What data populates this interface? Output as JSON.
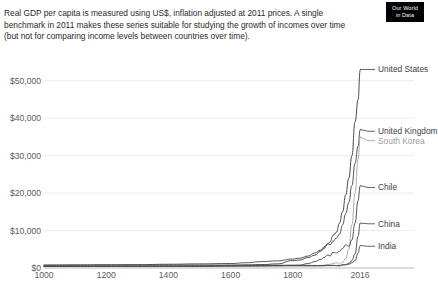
{
  "logo": {
    "line1": "Our World",
    "line2": "in Data",
    "name": "our-world-in-data-logo"
  },
  "subtitle": "Real GDP per capita is measured using US$, inflation adjusted at 2011 prices. A single benchmark in 2011 makes these series suitable for studying the growth of incomes over time (but not for comparing income levels between countries over time).",
  "chart_data": {
    "type": "line",
    "title": "",
    "subtitle": "Real GDP per capita is measured using US$, inflation adjusted at 2011 prices. A single benchmark in 2011 makes these series suitable for studying the growth of incomes over time (but not for comparing income levels between countries over time).",
    "xlabel": "",
    "ylabel": "",
    "xlim": [
      1000,
      2016
    ],
    "ylim": [
      0,
      55000
    ],
    "grid": true,
    "legend_position": "right-end-labels",
    "x_ticks": [
      {
        "value": 1000,
        "label": "1000"
      },
      {
        "value": 1200,
        "label": "1200"
      },
      {
        "value": 1400,
        "label": "1400"
      },
      {
        "value": 1600,
        "label": "1600"
      },
      {
        "value": 1800,
        "label": "1800"
      },
      {
        "value": 2016,
        "label": "2016"
      }
    ],
    "y_ticks": [
      {
        "value": 0,
        "label": "$0"
      },
      {
        "value": 10000,
        "label": "$10,000"
      },
      {
        "value": 20000,
        "label": "$20,000"
      },
      {
        "value": 30000,
        "label": "$30,000"
      },
      {
        "value": 40000,
        "label": "$40,000"
      },
      {
        "value": 50000,
        "label": "$50,000"
      }
    ],
    "x": [
      1000,
      1100,
      1200,
      1300,
      1400,
      1500,
      1600,
      1650,
      1700,
      1750,
      1800,
      1820,
      1850,
      1870,
      1890,
      1900,
      1913,
      1920,
      1929,
      1940,
      1950,
      1960,
      1970,
      1980,
      1990,
      2000,
      2010,
      2016
    ],
    "series": [
      {
        "name": "United States",
        "color": "#3f3f3f",
        "label_color": "#3f3f3f",
        "label_y_value": 53000,
        "values": [
          400,
          400,
          410,
          420,
          430,
          440,
          700,
          800,
          900,
          1100,
          1980,
          2100,
          2800,
          3400,
          4500,
          5200,
          6500,
          7000,
          8700,
          9500,
          12000,
          15000,
          19500,
          24000,
          30000,
          39000,
          45000,
          53000
        ]
      },
      {
        "name": "United Kingdom",
        "color": "#4a4a4a",
        "label_color": "#3f3f3f",
        "label_y_value": 36500,
        "values": [
          800,
          820,
          850,
          880,
          1000,
          1100,
          1200,
          1400,
          1700,
          1900,
          2400,
          2600,
          3200,
          4000,
          4800,
          5600,
          6500,
          6200,
          7100,
          8000,
          9000,
          11500,
          14500,
          17500,
          22000,
          28000,
          32500,
          37000
        ]
      },
      {
        "name": "South Korea",
        "color": "#a6a6a6",
        "label_color": "#9b9b9b",
        "label_y_value": 34000,
        "values": [
          450,
          450,
          460,
          470,
          480,
          500,
          520,
          540,
          560,
          580,
          600,
          610,
          620,
          640,
          680,
          760,
          950,
          980,
          1200,
          1400,
          1000,
          1500,
          2500,
          5000,
          11500,
          20000,
          29000,
          35000
        ]
      },
      {
        "name": "Chile",
        "color": "#4a4a4a",
        "label_color": "#3f3f3f",
        "label_y_value": 21500,
        "values": [
          400,
          400,
          410,
          420,
          430,
          440,
          500,
          530,
          560,
          620,
          700,
          720,
          1200,
          1700,
          2300,
          2800,
          3500,
          3200,
          4200,
          4000,
          4500,
          5200,
          6200,
          5800,
          7500,
          12000,
          18000,
          22000
        ]
      },
      {
        "name": "China",
        "color": "#4a4a4a",
        "label_color": "#3f3f3f",
        "label_y_value": 11800,
        "values": [
          700,
          750,
          800,
          820,
          800,
          790,
          780,
          760,
          750,
          740,
          730,
          730,
          700,
          680,
          650,
          650,
          700,
          680,
          720,
          650,
          600,
          900,
          950,
          1200,
          2000,
          3800,
          8500,
          12000
        ]
      },
      {
        "name": "India",
        "color": "#4a4a4a",
        "label_color": "#3f3f3f",
        "label_y_value": 5800,
        "values": [
          500,
          510,
          520,
          530,
          540,
          560,
          580,
          590,
          600,
          610,
          600,
          600,
          580,
          570,
          580,
          600,
          650,
          620,
          660,
          640,
          620,
          750,
          850,
          1000,
          1400,
          2000,
          4000,
          6000
        ]
      }
    ]
  }
}
